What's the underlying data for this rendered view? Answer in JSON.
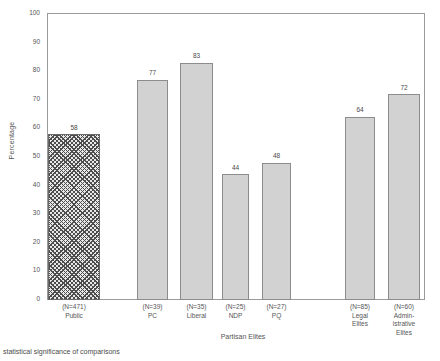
{
  "chart_data": {
    "type": "bar",
    "title": "",
    "xlabel": "Partisan Elites",
    "ylabel": "Percentage",
    "ylim": [
      0,
      100
    ],
    "ytick_step": 10,
    "yticks": [
      "100",
      "90",
      "80",
      "70",
      "60",
      "50",
      "40",
      "30",
      "20",
      "10",
      "0"
    ],
    "grid": false,
    "legend": "none",
    "categories": [
      "Public",
      "PC",
      "Liberal",
      "NDP",
      "PQ",
      "Legal Elites",
      "Administrative Elites"
    ],
    "values": [
      58,
      77,
      83,
      44,
      48,
      64,
      72
    ],
    "sample_sizes": [
      "(N=471)",
      "(N=39)",
      "(N=35)",
      "(N=25)",
      "(N=27)",
      "(N=85)",
      "(N=60)"
    ],
    "bar_labels": [
      "58",
      "77",
      "83",
      "44",
      "48",
      "64",
      "72"
    ],
    "colors": {
      "bar_fill": "#d2d2d2",
      "bar_edge": "#8c8c8c",
      "hatch_fill": "#e8e8e8",
      "hatch_line": "#4d4d4d",
      "axis": "#9a9a9a",
      "text": "#4a4a4a"
    },
    "bars": [
      {
        "label": "58",
        "value": 58,
        "n": "(N=471)",
        "name_lines": [
          "Public"
        ],
        "hatched": true,
        "left": 0,
        "width": 52
      },
      {
        "label": "77",
        "value": 77,
        "n": "(N=39)",
        "name_lines": [
          "PC"
        ],
        "hatched": false,
        "left": 89,
        "width": 31
      },
      {
        "label": "83",
        "value": 83,
        "n": "(N=35)",
        "name_lines": [
          "Liberal"
        ],
        "hatched": false,
        "left": 132,
        "width": 33
      },
      {
        "label": "44",
        "value": 44,
        "n": "(N=25)",
        "name_lines": [
          "NDP"
        ],
        "hatched": false,
        "left": 174,
        "width": 27
      },
      {
        "label": "48",
        "value": 48,
        "n": "(N=27)",
        "name_lines": [
          "PQ"
        ],
        "hatched": false,
        "left": 214,
        "width": 29
      },
      {
        "label": "64",
        "value": 64,
        "n": "(N=85)",
        "name_lines": [
          "Legal",
          "Elites"
        ],
        "hatched": false,
        "left": 297,
        "width": 30
      },
      {
        "label": "72",
        "value": 72,
        "n": "(N=60)",
        "name_lines": [
          "Admin-",
          "istrative",
          "Elites"
        ],
        "hatched": false,
        "left": 340,
        "width": 32
      }
    ]
  },
  "footer": {
    "caption": "statistical significance of comparisons"
  }
}
